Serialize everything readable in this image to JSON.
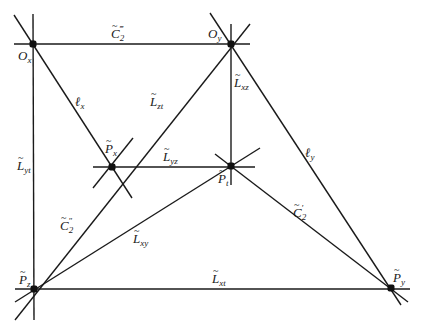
{
  "diagram": {
    "points": [
      {
        "id": "Ox",
        "name": "O",
        "sub": "x",
        "tilde": false,
        "x": 33,
        "y": 44,
        "lx": 18,
        "ly": 60
      },
      {
        "id": "Oy",
        "name": "O",
        "sub": "y",
        "tilde": false,
        "x": 231,
        "y": 44,
        "lx": 208,
        "ly": 38
      },
      {
        "id": "Px",
        "name": "P",
        "sub": "x",
        "tilde": true,
        "x": 112,
        "y": 167,
        "lx": 105,
        "ly": 153
      },
      {
        "id": "Pt",
        "name": "P",
        "sub": "t",
        "tilde": true,
        "x": 231,
        "y": 166,
        "lx": 218,
        "ly": 183
      },
      {
        "id": "Pz",
        "name": "P",
        "sub": "z",
        "tilde": true,
        "x": 34,
        "y": 289,
        "lx": 19,
        "ly": 284
      },
      {
        "id": "Py",
        "name": "P",
        "sub": "y",
        "tilde": true,
        "x": 391,
        "y": 288,
        "lx": 393,
        "ly": 282
      }
    ],
    "lines": [
      {
        "id": "L_yt",
        "name": "L",
        "sub": "yt",
        "tilde": true,
        "x1": 33,
        "y1": 14,
        "x2": 34,
        "y2": 320,
        "lx": 17,
        "ly": 170
      },
      {
        "id": "C2_triple",
        "name": "C",
        "sub": "2",
        "sup": "‴",
        "tilde": true,
        "x1": 14,
        "y1": 44,
        "x2": 250,
        "y2": 44,
        "lx": 111,
        "ly": 38
      },
      {
        "id": "l_x",
        "name": "ℓ",
        "sub": "x",
        "tilde": false,
        "x1": 14,
        "y1": 15,
        "x2": 132,
        "y2": 198,
        "lx": 75,
        "ly": 106
      },
      {
        "id": "L_zt",
        "name": "L",
        "sub": "zt",
        "tilde": true,
        "x1": 250,
        "y1": 24,
        "x2": 15,
        "y2": 320,
        "lx": 150,
        "ly": 106
      },
      {
        "id": "L_xz",
        "name": "L",
        "sub": "xz",
        "tilde": true,
        "x1": 231,
        "y1": 24,
        "x2": 231,
        "y2": 185,
        "lx": 234,
        "ly": 87
      },
      {
        "id": "l_y",
        "name": "ℓ",
        "sub": "y",
        "tilde": false,
        "x1": 210,
        "y1": 13,
        "x2": 401,
        "y2": 305,
        "lx": 305,
        "ly": 157
      },
      {
        "id": "L_yz",
        "name": "L",
        "sub": "yz",
        "tilde": true,
        "x1": 93,
        "y1": 167,
        "x2": 255,
        "y2": 167,
        "lx": 163,
        "ly": 161
      },
      {
        "id": "C2_prime",
        "name": "C",
        "sub": "2",
        "sup": "′",
        "tilde": true,
        "x1": 215,
        "y1": 154,
        "x2": 408,
        "y2": 302,
        "lx": 293,
        "ly": 217
      },
      {
        "id": "L_xy",
        "name": "L",
        "sub": "xy",
        "tilde": true,
        "x1": 260,
        "y1": 148,
        "x2": 15,
        "y2": 302,
        "lx": 133,
        "ly": 243
      },
      {
        "id": "L_xt",
        "name": "L",
        "sub": "xt",
        "tilde": true,
        "x1": 15,
        "y1": 289,
        "x2": 410,
        "y2": 289,
        "lx": 212,
        "ly": 283
      },
      {
        "id": "C2_double",
        "name": "C",
        "sub": "2",
        "sup": "″",
        "tilde": true,
        "x1": 0,
        "y1": 0,
        "x2": 0,
        "y2": 0,
        "lx": 60,
        "ly": 230
      },
      {
        "id": "aux_px",
        "name": "",
        "sub": "",
        "tilde": false,
        "x1": 93,
        "y1": 188,
        "x2": 133,
        "y2": 138,
        "lx": 0,
        "ly": 0
      }
    ]
  }
}
